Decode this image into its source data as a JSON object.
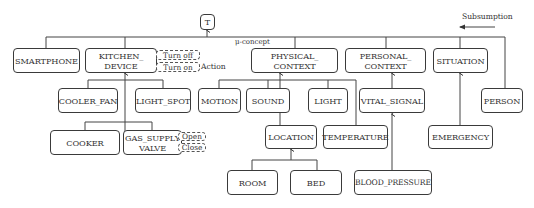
{
  "diagram": {
    "root": "T",
    "legend": {
      "subsumption_label": "Subsumption",
      "mu_concept_label": "μ-concept",
      "action_label": "Action"
    },
    "nodes": {
      "smartphone": "SMARTPHONE",
      "kitchen_device": "KITCHEN_\nDEVICE",
      "physical_context": "PHYSICAL_\nCONTEXT",
      "personal_context": "PERSONAL_\nCONTEXT",
      "situation": "SITUATION",
      "cooler_fan": "COOLER_FAN",
      "light_spot": "LIGHT_SPOT",
      "motion": "MOTION",
      "sound": "SOUND",
      "light": "LIGHT",
      "vital_signal": "VITAL_SIGNAL",
      "person": "PERSON",
      "cooker": "COOKER",
      "gas_supply_valve": "GAS_SUPPLY\nVALVE",
      "location": "LOCATION",
      "temperature": "TEMPERATURE",
      "emergency": "EMERGENCY",
      "room": "ROOM",
      "bed": "BED",
      "blood_pressure": "BLOOD_PRESSURE"
    },
    "actions": {
      "kitchen_device": [
        "Turn off",
        "Turn on"
      ],
      "gas_supply_valve": [
        "Open",
        "Close"
      ]
    },
    "edges": [
      [
        "SMARTPHONE",
        "T"
      ],
      [
        "KITCHEN_DEVICE",
        "T"
      ],
      [
        "PHYSICAL_CONTEXT",
        "T"
      ],
      [
        "PERSONAL_CONTEXT",
        "T"
      ],
      [
        "SITUATION",
        "T"
      ],
      [
        "PERSON",
        "T"
      ],
      [
        "COOLER_FAN",
        "KITCHEN_DEVICE"
      ],
      [
        "LIGHT_SPOT",
        "KITCHEN_DEVICE"
      ],
      [
        "COOKER",
        "KITCHEN_DEVICE"
      ],
      [
        "GAS_SUPPLY_VALVE",
        "KITCHEN_DEVICE"
      ],
      [
        "MOTION",
        "PHYSICAL_CONTEXT"
      ],
      [
        "SOUND",
        "PHYSICAL_CONTEXT"
      ],
      [
        "LIGHT",
        "PHYSICAL_CONTEXT"
      ],
      [
        "LOCATION",
        "PHYSICAL_CONTEXT"
      ],
      [
        "TEMPERATURE",
        "PHYSICAL_CONTEXT"
      ],
      [
        "VITAL_SIGNAL",
        "PERSONAL_CONTEXT"
      ],
      [
        "BLOOD_PRESSURE",
        "VITAL_SIGNAL"
      ],
      [
        "EMERGENCY",
        "SITUATION"
      ],
      [
        "ROOM",
        "LOCATION"
      ],
      [
        "BED",
        "LOCATION"
      ]
    ]
  }
}
